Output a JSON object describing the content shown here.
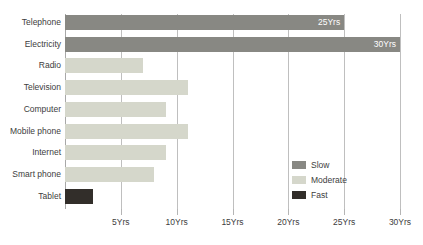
{
  "chart_data": {
    "type": "bar",
    "orientation": "horizontal",
    "title": "",
    "subtitle": "",
    "xlabel": "",
    "ylabel": "",
    "xlim": [
      0,
      30
    ],
    "grid": true,
    "categories": [
      "Telephone",
      "Electricity",
      "Radio",
      "Television",
      "Computer",
      "Mobile phone",
      "Internet",
      "Smart phone",
      "Tablet"
    ],
    "values": [
      25,
      30,
      7,
      11,
      9,
      11,
      9,
      8,
      2.5
    ],
    "point_labels": [
      "25Yrs",
      "30Yrs",
      "",
      "",
      "",
      "",
      "",
      "",
      ""
    ],
    "series_of_point": [
      "Slow",
      "Slow",
      "Moderate",
      "Moderate",
      "Moderate",
      "Moderate",
      "Moderate",
      "Moderate",
      "Fast"
    ],
    "xticks": [
      5,
      10,
      15,
      20,
      25,
      30
    ],
    "xticklabels": [
      "5Yrs",
      "10Yrs",
      "15Yrs",
      "20Yrs",
      "25Yrs",
      "30Yrs"
    ],
    "legend": {
      "position": "inside-bottom-right",
      "entries": [
        {
          "label": "Slow",
          "color": "#888883"
        },
        {
          "label": "Moderate",
          "color": "#d5d7cb"
        },
        {
          "label": "Fast",
          "color": "#322e2a"
        }
      ]
    },
    "colors": {
      "slow": "#888883",
      "moderate": "#d5d7cb",
      "fast": "#322e2a",
      "gridline": "#bfbfbf",
      "axis": "#a8a8a8",
      "text": "#3d3d3d",
      "bar_label_text": "#ffffff",
      "background": "#ffffff"
    }
  }
}
